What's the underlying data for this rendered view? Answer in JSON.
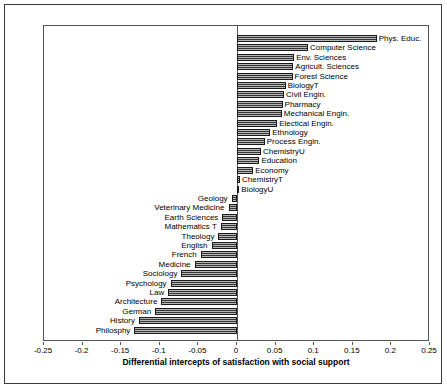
{
  "chart_data": {
    "type": "bar",
    "orientation": "horizontal",
    "title": "",
    "xlabel": "Differential intercepts of satisfaction with social support",
    "ylabel": "",
    "xlim": [
      -0.25,
      0.25
    ],
    "xticks": [
      -0.25,
      -0.2,
      -0.15,
      -0.1,
      -0.05,
      0,
      0.05,
      0.1,
      0.15,
      0.2,
      0.25
    ],
    "xtick_labels": [
      "-0.25",
      "-0.2",
      "-0.15",
      "-0.1",
      "-0.05",
      "0",
      "0.05",
      "0.1",
      "0.15",
      "0.2",
      "0.25"
    ],
    "grid": false,
    "legend": "none",
    "bar_color": "#5e5e5e",
    "bar_edge_color": "#1a1a1a",
    "categories": [
      "Phys. Educ.",
      "Computer Science",
      "Env. Sciences",
      "Agricult. Sciences",
      "Forest Science",
      "BiologyT",
      "Civil Engin.",
      "Pharmacy",
      "Mechanical Engin.",
      "Electical Engin.",
      "Ethnology",
      "Process Engin.",
      "ChemistryU",
      "Education",
      "Economy",
      "ChemistryT",
      "BiologyU",
      "Geology",
      "Veterinary Medicine",
      "Earth Sciences",
      "Mathematics T",
      "Theology",
      "English",
      "French",
      "Medicine",
      "Sociology",
      "Psychology",
      "Law",
      "Architecture",
      "German",
      "History",
      "Philosphy"
    ],
    "values": [
      0.181,
      0.092,
      0.074,
      0.073,
      0.072,
      0.063,
      0.061,
      0.059,
      0.058,
      0.052,
      0.043,
      0.036,
      0.031,
      0.029,
      0.021,
      0.004,
      0.003,
      -0.007,
      -0.011,
      -0.019,
      -0.021,
      -0.024,
      -0.033,
      -0.047,
      -0.055,
      -0.072,
      -0.086,
      -0.089,
      -0.098,
      -0.106,
      -0.127,
      -0.133
    ]
  }
}
